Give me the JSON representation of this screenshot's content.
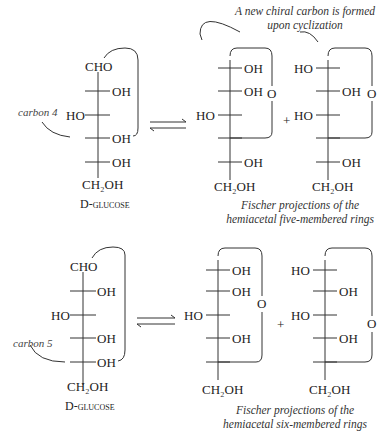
{
  "top_section": {
    "annotation_top": "A new chiral carbon is formed",
    "annotation_top2": "upon cyclization",
    "glucose_label": "D-glucose",
    "carbon_label": "carbon 4",
    "caption1": "Fischer projections of the",
    "caption2": "hemiacetal five-membered rings"
  },
  "bottom_section": {
    "glucose_label": "D-glucose",
    "carbon_label": "carbon 5",
    "caption1": "Fischer projections of the",
    "caption2": "hemiacetal six-membered rings"
  },
  "labels": {
    "cho": "CHO",
    "oh": "OH",
    "ho": "HO",
    "o": "O",
    "plus": "+",
    "ch2oh": "CH₂OH"
  }
}
